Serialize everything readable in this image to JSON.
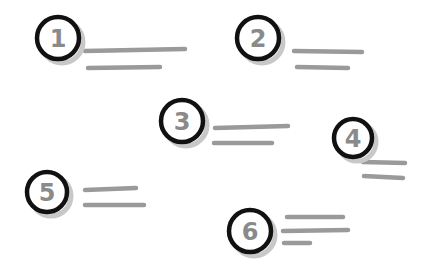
{
  "diagram": {
    "background": "#ffffff",
    "colors": {
      "circle_stroke": "#111111",
      "shadow": "#c8c8c8",
      "number": "#8a8a8a",
      "line": "#9a9a9a"
    },
    "items": [
      {
        "label": "1",
        "cx": 58,
        "cy": 38,
        "r": 21,
        "lines": [
          [
            85,
            51,
            185,
            49
          ],
          [
            88,
            68,
            160,
            67
          ]
        ]
      },
      {
        "label": "2",
        "cx": 258,
        "cy": 38,
        "r": 21,
        "lines": [
          [
            294,
            51,
            362,
            52
          ],
          [
            297,
            67,
            348,
            68
          ]
        ]
      },
      {
        "label": "3",
        "cx": 182,
        "cy": 121,
        "r": 21,
        "lines": [
          [
            215,
            128,
            288,
            126
          ],
          [
            214,
            143,
            272,
            143
          ]
        ]
      },
      {
        "label": "4",
        "cx": 353,
        "cy": 138,
        "r": 19,
        "lines": [
          [
            363,
            162,
            405,
            163
          ],
          [
            364,
            176,
            403,
            178
          ]
        ]
      },
      {
        "label": "5",
        "cx": 47,
        "cy": 192,
        "r": 20,
        "lines": [
          [
            85,
            190,
            136,
            188
          ],
          [
            85,
            205,
            144,
            205
          ]
        ]
      },
      {
        "label": "6",
        "cx": 250,
        "cy": 231,
        "r": 21,
        "lines": [
          [
            287,
            217,
            343,
            217
          ],
          [
            283,
            231,
            348,
            230
          ],
          [
            284,
            243,
            310,
            243
          ]
        ]
      }
    ]
  }
}
